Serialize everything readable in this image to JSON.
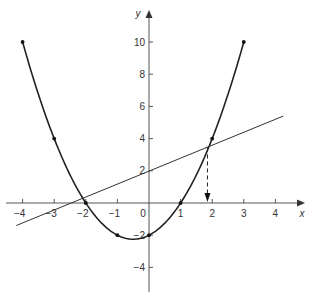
{
  "chart_data": {
    "type": "line",
    "title": "",
    "xlabel": "x",
    "ylabel": "y",
    "xlim": [
      -4.4,
      5
    ],
    "ylim": [
      -5.5,
      11.5
    ],
    "grid": false,
    "x_ticks": [
      -4,
      -3,
      -2,
      -1,
      1,
      2,
      3,
      4
    ],
    "y_ticks": [
      -4,
      -2,
      2,
      4,
      6,
      8,
      10
    ],
    "origin_label": "0",
    "series": [
      {
        "name": "parabola y = x^2 + x - 2",
        "kind": "curve",
        "x": [
          -4,
          -3,
          -2,
          -1,
          0,
          1,
          2,
          3
        ],
        "values": [
          10,
          4,
          0,
          -2,
          -2,
          0,
          4,
          10
        ],
        "marked_points": true
      },
      {
        "name": "line y = 0.8x + 2",
        "kind": "straight",
        "x": [
          -4.2,
          4.25
        ],
        "values": [
          -1.4,
          5.4
        ]
      }
    ],
    "annotations": [
      {
        "type": "dashed-arrow",
        "x": 1.85,
        "from_y": 3.45,
        "to_y": 0,
        "description": "drop from intersection to x-axis"
      }
    ]
  }
}
